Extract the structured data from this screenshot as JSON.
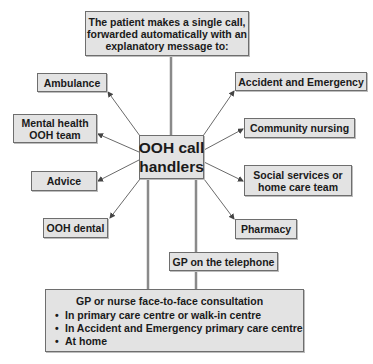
{
  "diagram": {
    "title_box": {
      "lines": [
        "The patient makes a single call,",
        "forwarded automatically with an",
        "explanatory message to:"
      ]
    },
    "hub": {
      "lines": [
        "OOH call",
        "handlers"
      ]
    },
    "destinations": {
      "ambulance": {
        "lines": [
          "Ambulance"
        ]
      },
      "accident_emergency": {
        "lines": [
          "Accident and Emergency"
        ]
      },
      "mental_health": {
        "lines": [
          "Mental health",
          "OOH team"
        ]
      },
      "community_nursing": {
        "lines": [
          "Community nursing"
        ]
      },
      "advice": {
        "lines": [
          "Advice"
        ]
      },
      "social_services": {
        "lines": [
          "Social services or",
          "home care team"
        ]
      },
      "ooh_dental": {
        "lines": [
          "OOH dental"
        ]
      },
      "pharmacy": {
        "lines": [
          "Pharmacy"
        ]
      },
      "gp_telephone": {
        "lines": [
          "GP on the telephone"
        ]
      }
    },
    "consultation": {
      "title": "GP or nurse face-to-face consultation",
      "items": [
        "In primary care centre or walk-in centre",
        "In Accident and Emergency primary care centre",
        "At home"
      ]
    },
    "colors": {
      "box_fill": "#e3e3e3",
      "box_border": "#6e6e6e",
      "connector": "#8a8a8a",
      "arrow": "#555555",
      "text": "#1a1a1a"
    }
  }
}
